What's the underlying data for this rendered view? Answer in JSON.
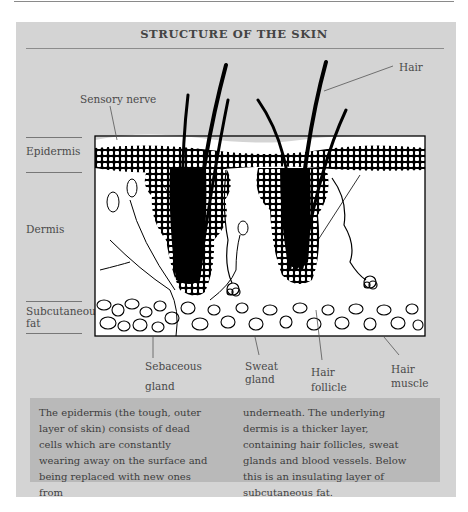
{
  "diagram": {
    "title": "STRUCTURE OF THE SKIN",
    "layer_labels": {
      "epidermis": "Epidermis",
      "dermis": "Dermis",
      "subcutaneous_line1": "Subcutaneous",
      "subcutaneous_line2": "fat"
    },
    "callouts": {
      "hair": "Hair",
      "sensory_nerve": "Sensory nerve",
      "sebaceous_line1": "Sebaceous",
      "sebaceous_line2": "gland",
      "sweat_line1": "Sweat",
      "sweat_line2": "gland",
      "hair_follicle_line1": "Hair",
      "hair_follicle_line2": "follicle",
      "hair_muscle_line1": "Hair",
      "hair_muscle_line2": "muscle"
    },
    "caption": {
      "col1": "The epidermis (the tough, outer layer of skin) consists of dead cells which are constantly wearing away on the surface and being replaced with new ones from",
      "col2": "underneath. The underlying dermis is a thicker layer, containing hair follicles, sweat glands and blood vessels. Below this is an insulating layer of subcutaneous fat."
    }
  },
  "colors": {
    "panel": "#d4d4d4",
    "caption_box": "#b9b9b9",
    "ink": "#000000"
  }
}
